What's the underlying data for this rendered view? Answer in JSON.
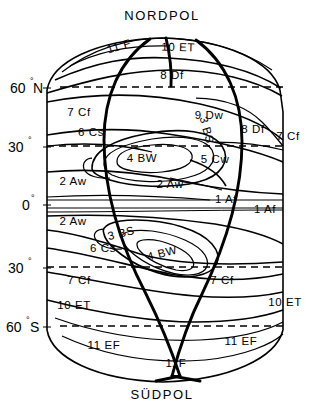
{
  "figure": {
    "type": "schematic-map",
    "title_top": "NORDPOL",
    "title_bottom": "SÜDPOL",
    "background": "#ffffff",
    "line_color": "#000000"
  },
  "latitude_axis": {
    "labels": [
      {
        "id": "lat-60n",
        "value": "60",
        "degree": "°",
        "hemisphere": "N",
        "y_px": 88
      },
      {
        "id": "lat-30n",
        "value": "30",
        "degree": "°",
        "hemisphere": "",
        "y_px": 147
      },
      {
        "id": "lat-0",
        "value": "0",
        "degree": "°",
        "hemisphere": "",
        "y_px": 205
      },
      {
        "id": "lat-30s",
        "value": "30",
        "degree": "°",
        "hemisphere": "",
        "y_px": 268
      },
      {
        "id": "lat-60s",
        "value": "60",
        "degree": "°",
        "hemisphere": "S",
        "y_px": 327
      }
    ],
    "dashed_latitudes": [
      "60N",
      "30N",
      "30S",
      "60S"
    ]
  },
  "zones": {
    "northern": [
      {
        "id": "z-11f-n",
        "label": "11 F",
        "x": 120,
        "y": 50,
        "rotate": -17
      },
      {
        "id": "z-10et-n",
        "label": "10 ET",
        "x": 178,
        "y": 51,
        "rotate": 2
      },
      {
        "id": "z-8df-n",
        "label": "8 Df",
        "x": 172,
        "y": 79,
        "rotate": 0
      },
      {
        "id": "z-9dw-n",
        "label": "9 Dw",
        "x": 209,
        "y": 119,
        "rotate": 0
      },
      {
        "id": "z-8df-ne",
        "label": "8 Df",
        "x": 253,
        "y": 133,
        "rotate": 0
      },
      {
        "id": "z-7cf-nw",
        "label": "7 Cf",
        "x": 79,
        "y": 116,
        "rotate": 0
      },
      {
        "id": "z-7cf-ne",
        "label": "7 Cf",
        "x": 288,
        "y": 140,
        "rotate": 0
      },
      {
        "id": "z-6cs-n",
        "label": "6 Cs",
        "x": 91,
        "y": 136,
        "rotate": 0
      },
      {
        "id": "z-3bs-n",
        "label": "3 BS",
        "x": 203,
        "y": 131,
        "rotate": 75
      },
      {
        "id": "z-4bw-n",
        "label": "4 BW",
        "x": 142,
        "y": 162,
        "rotate": 0
      },
      {
        "id": "z-5cw-n",
        "label": "5 Cw",
        "x": 215,
        "y": 163,
        "rotate": 0
      },
      {
        "id": "z-2aw-nw",
        "label": "2 Aw",
        "x": 73,
        "y": 185,
        "rotate": 0
      },
      {
        "id": "z-2aw-n",
        "label": "2 Aw",
        "x": 170,
        "y": 188,
        "rotate": 0
      }
    ],
    "equatorial": [
      {
        "id": "z-1af-c",
        "label": "1 Af",
        "x": 226,
        "y": 203,
        "rotate": 0
      },
      {
        "id": "z-1af-e",
        "label": "1 Af",
        "x": 265,
        "y": 213,
        "rotate": 0
      }
    ],
    "southern": [
      {
        "id": "z-2aw-s",
        "label": "2 Aw",
        "x": 73,
        "y": 225,
        "rotate": 0
      },
      {
        "id": "z-3bs-s",
        "label": "3 BS",
        "x": 122,
        "y": 237,
        "rotate": -14
      },
      {
        "id": "z-4bw-s",
        "label": "4 BW",
        "x": 163,
        "y": 257,
        "rotate": -14
      },
      {
        "id": "z-6cs-s",
        "label": "6 Cs",
        "x": 103,
        "y": 252,
        "rotate": 0
      },
      {
        "id": "z-7cf-sw",
        "label": "7 Cf",
        "x": 79,
        "y": 284,
        "rotate": 0
      },
      {
        "id": "z-7cf-se",
        "label": "7 Cf",
        "x": 222,
        "y": 284,
        "rotate": 0
      },
      {
        "id": "z-10et-sw",
        "label": "10 ET",
        "x": 74,
        "y": 309,
        "rotate": 0
      },
      {
        "id": "z-10et-se",
        "label": "10 ET",
        "x": 285,
        "y": 306,
        "rotate": 0
      },
      {
        "id": "z-11ef-sw",
        "label": "11 EF",
        "x": 104,
        "y": 349,
        "rotate": 0
      },
      {
        "id": "z-11ef-se",
        "label": "11 EF",
        "x": 241,
        "y": 345,
        "rotate": 0
      },
      {
        "id": "z-11f-s",
        "label": "11F",
        "x": 176,
        "y": 367,
        "rotate": 0
      }
    ]
  },
  "legend_keys": [
    "1 Af",
    "2 Aw",
    "3 BS",
    "4 BW",
    "5 Cw",
    "6 Cs",
    "7 Cf",
    "8 Df",
    "9 Dw",
    "10 ET",
    "11 EF",
    "11 F"
  ]
}
